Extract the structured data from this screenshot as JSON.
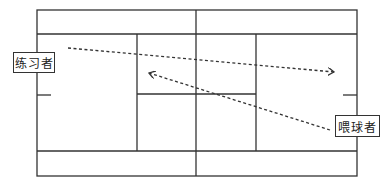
{
  "diagram": {
    "type": "badminton-court-drill",
    "line_color": "#333333",
    "background": "#ffffff",
    "labels": {
      "practitioner": "练习者",
      "feeder": "喂球者"
    },
    "arrows": [
      {
        "name": "practitioner-shot",
        "from": "练习者 (left front)",
        "to": "right back court",
        "style": "dotted",
        "direction": "left-to-right"
      },
      {
        "name": "feeder-shot",
        "from": "喂球者 (right)",
        "to": "left center court",
        "style": "dotted",
        "direction": "right-to-left"
      }
    ]
  }
}
